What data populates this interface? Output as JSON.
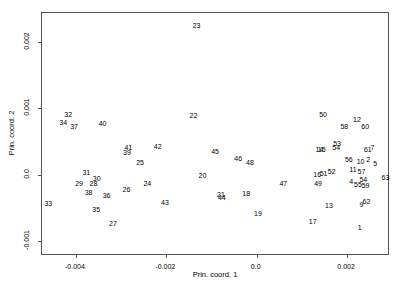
{
  "chart_data": {
    "type": "scatter",
    "title": "",
    "xlabel": "Prin. coord. 1",
    "ylabel": "Prin. coord. 2",
    "xlim": [
      -0.00475,
      0.00295
    ],
    "ylim": [
      -0.00122,
      0.00243
    ],
    "grid": false,
    "legend": null,
    "marker_style": "text-label",
    "xticks": [
      -0.004,
      -0.002,
      0.0,
      0.002
    ],
    "xtick_labels": [
      "-0.004",
      "-0.002",
      "0.0",
      "0.002"
    ],
    "yticks": [
      -0.001,
      0.0,
      0.001,
      0.002
    ],
    "ytick_labels": [
      "-0.001",
      "0.0",
      "0.001",
      "0.002"
    ],
    "points": [
      {
        "label": "23",
        "x": -0.00133,
        "y": 0.00225
      },
      {
        "label": "32",
        "x": -0.00417,
        "y": 0.00092
      },
      {
        "label": "22",
        "x": -0.0014,
        "y": 0.0009
      },
      {
        "label": "50",
        "x": 0.00147,
        "y": 0.00091
      },
      {
        "label": "34",
        "x": -0.00428,
        "y": 0.00079
      },
      {
        "label": "12",
        "x": 0.00222,
        "y": 0.00084
      },
      {
        "label": "40",
        "x": -0.00341,
        "y": 0.00078
      },
      {
        "label": "37",
        "x": -0.00404,
        "y": 0.00073
      },
      {
        "label": "58",
        "x": 0.00194,
        "y": 0.00074
      },
      {
        "label": "60",
        "x": 0.0024,
        "y": 0.00073
      },
      {
        "label": "53",
        "x": 0.00178,
        "y": 0.00047
      },
      {
        "label": "54",
        "x": 0.00176,
        "y": 0.00042
      },
      {
        "label": "7",
        "x": 0.00256,
        "y": 0.00042
      },
      {
        "label": "41",
        "x": -0.00284,
        "y": 0.00042
      },
      {
        "label": "42",
        "x": -0.00219,
        "y": 0.00043
      },
      {
        "label": "61",
        "x": 0.00246,
        "y": 0.00038
      },
      {
        "label": "14",
        "x": 0.00139,
        "y": 0.00038
      },
      {
        "label": "15",
        "x": 0.00144,
        "y": 0.00038
      },
      {
        "label": "45",
        "x": -0.00092,
        "y": 0.00036
      },
      {
        "label": "39",
        "x": -0.00287,
        "y": 0.00034
      },
      {
        "label": "46",
        "x": -0.00041,
        "y": 0.00025
      },
      {
        "label": "56",
        "x": 0.00204,
        "y": 0.00023
      },
      {
        "label": "10",
        "x": 0.0023,
        "y": 0.00021
      },
      {
        "label": "2",
        "x": 0.00247,
        "y": 0.00024
      },
      {
        "label": "48",
        "x": -0.00015,
        "y": 0.00019
      },
      {
        "label": "25",
        "x": -0.00258,
        "y": 0.00019
      },
      {
        "label": "5",
        "x": 0.00262,
        "y": 0.00018
      },
      {
        "label": "11",
        "x": 0.00213,
        "y": 8e-05
      },
      {
        "label": "52",
        "x": 0.00166,
        "y": 6e-05
      },
      {
        "label": "57",
        "x": 0.00232,
        "y": 6e-05
      },
      {
        "label": "51",
        "x": 0.00148,
        "y": 3e-05
      },
      {
        "label": "31",
        "x": -0.00377,
        "y": 4e-05
      },
      {
        "label": "16",
        "x": 0.00134,
        "y": 1e-05
      },
      {
        "label": "20",
        "x": -0.0012,
        "y": -1e-05
      },
      {
        "label": "63",
        "x": 0.00285,
        "y": -4e-05
      },
      {
        "label": "30",
        "x": -0.00354,
        "y": -5e-05
      },
      {
        "label": "54b",
        "x": 0.00236,
        "y": -6e-05
      },
      {
        "label": "4",
        "x": 0.00209,
        "y": -0.0001
      },
      {
        "label": "29",
        "x": -0.00393,
        "y": -0.00012
      },
      {
        "label": "28",
        "x": -0.00361,
        "y": -0.00013
      },
      {
        "label": "49",
        "x": 0.00136,
        "y": -0.00012
      },
      {
        "label": "24",
        "x": -0.00242,
        "y": -0.00012
      },
      {
        "label": "55",
        "x": 0.00224,
        "y": -0.00014
      },
      {
        "label": "59",
        "x": 0.00241,
        "y": -0.00015
      },
      {
        "label": "47",
        "x": 0.00059,
        "y": -0.00013
      },
      {
        "label": "26",
        "x": -0.00288,
        "y": -0.00021
      },
      {
        "label": "38",
        "x": -0.00372,
        "y": -0.00026
      },
      {
        "label": "36",
        "x": -0.00332,
        "y": -0.0003
      },
      {
        "label": "18",
        "x": -0.00023,
        "y": -0.00028
      },
      {
        "label": "21",
        "x": -0.00079,
        "y": -0.00029
      },
      {
        "label": "44",
        "x": -0.00077,
        "y": -0.00033
      },
      {
        "label": "62",
        "x": 0.00243,
        "y": -0.0004
      },
      {
        "label": "43",
        "x": -0.00203,
        "y": -0.00041
      },
      {
        "label": "33",
        "x": -0.00461,
        "y": -0.00043
      },
      {
        "label": "9",
        "x": 0.00232,
        "y": -0.00044
      },
      {
        "label": "13",
        "x": 0.0016,
        "y": -0.00045
      },
      {
        "label": "35",
        "x": -0.00355,
        "y": -0.00052
      },
      {
        "label": "19",
        "x": 3e-05,
        "y": -0.00057
      },
      {
        "label": "17",
        "x": 0.00124,
        "y": -0.0007
      },
      {
        "label": "27",
        "x": -0.00318,
        "y": -0.00073
      },
      {
        "label": "1",
        "x": 0.00228,
        "y": -0.00078
      }
    ]
  }
}
